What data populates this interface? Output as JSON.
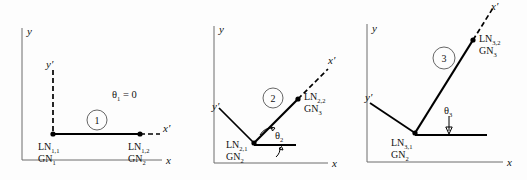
{
  "figure": {
    "panel_count": 3
  },
  "axes": {
    "global_x": "x",
    "global_y": "y",
    "local_x": "x′",
    "local_y": "y′"
  },
  "panels": [
    {
      "element_number": "1",
      "angle_label": "θ",
      "angle_sub": "1",
      "angle_value": "= 0",
      "angle_text": "θ₁ = 0",
      "start_node": {
        "local": "LN",
        "local_sub": "1,1",
        "global": "GN",
        "global_sub": "1"
      },
      "end_node": {
        "local": "LN",
        "local_sub": "1,2",
        "global": "GN",
        "global_sub": "2"
      }
    },
    {
      "element_number": "2",
      "angle_label": "θ",
      "angle_sub": "2",
      "angle_value": "",
      "angle_text": "θ₂",
      "start_node": {
        "local": "LN",
        "local_sub": "2,1",
        "global": "GN",
        "global_sub": "2"
      },
      "end_node": {
        "local": "LN",
        "local_sub": "2,2",
        "global": "GN",
        "global_sub": "3"
      }
    },
    {
      "element_number": "3",
      "angle_label": "θ",
      "angle_sub": "3",
      "angle_value": "",
      "angle_text": "θ₃",
      "start_node": {
        "local": "LN",
        "local_sub": "3,1",
        "global": "GN",
        "global_sub": "2"
      },
      "end_node": {
        "local": "LN",
        "local_sub": "3,2",
        "global": "GN",
        "global_sub": "3"
      }
    }
  ],
  "colors": {
    "member": "#000000",
    "axis": "#6d6d6d",
    "text": "#111111",
    "circle": "#555555",
    "background": "#fdfdfd"
  }
}
